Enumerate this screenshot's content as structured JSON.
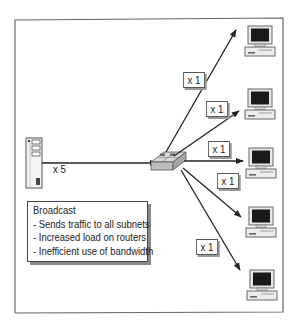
{
  "diagram": {
    "source": {
      "type": "server",
      "label": "x 5"
    },
    "hub": {
      "type": "switch"
    },
    "destinations": [
      {
        "type": "computer",
        "label": "x 1"
      },
      {
        "type": "computer",
        "label": "x 1"
      },
      {
        "type": "computer",
        "label": "x 1"
      },
      {
        "type": "computer",
        "label": "x 1"
      },
      {
        "type": "computer",
        "label": "x 1"
      }
    ],
    "note": {
      "heading": "Broadcast",
      "items": [
        "- Sends traffic to all subnets",
        "- Increased load on routers",
        "- Inefficient use of bandwidth"
      ]
    },
    "colors": {
      "frame": "#555555",
      "line": "#222222",
      "screen": "#1a1a1a",
      "device_fill": "#e6e6e6",
      "shadow": "#8a8a8a"
    }
  }
}
